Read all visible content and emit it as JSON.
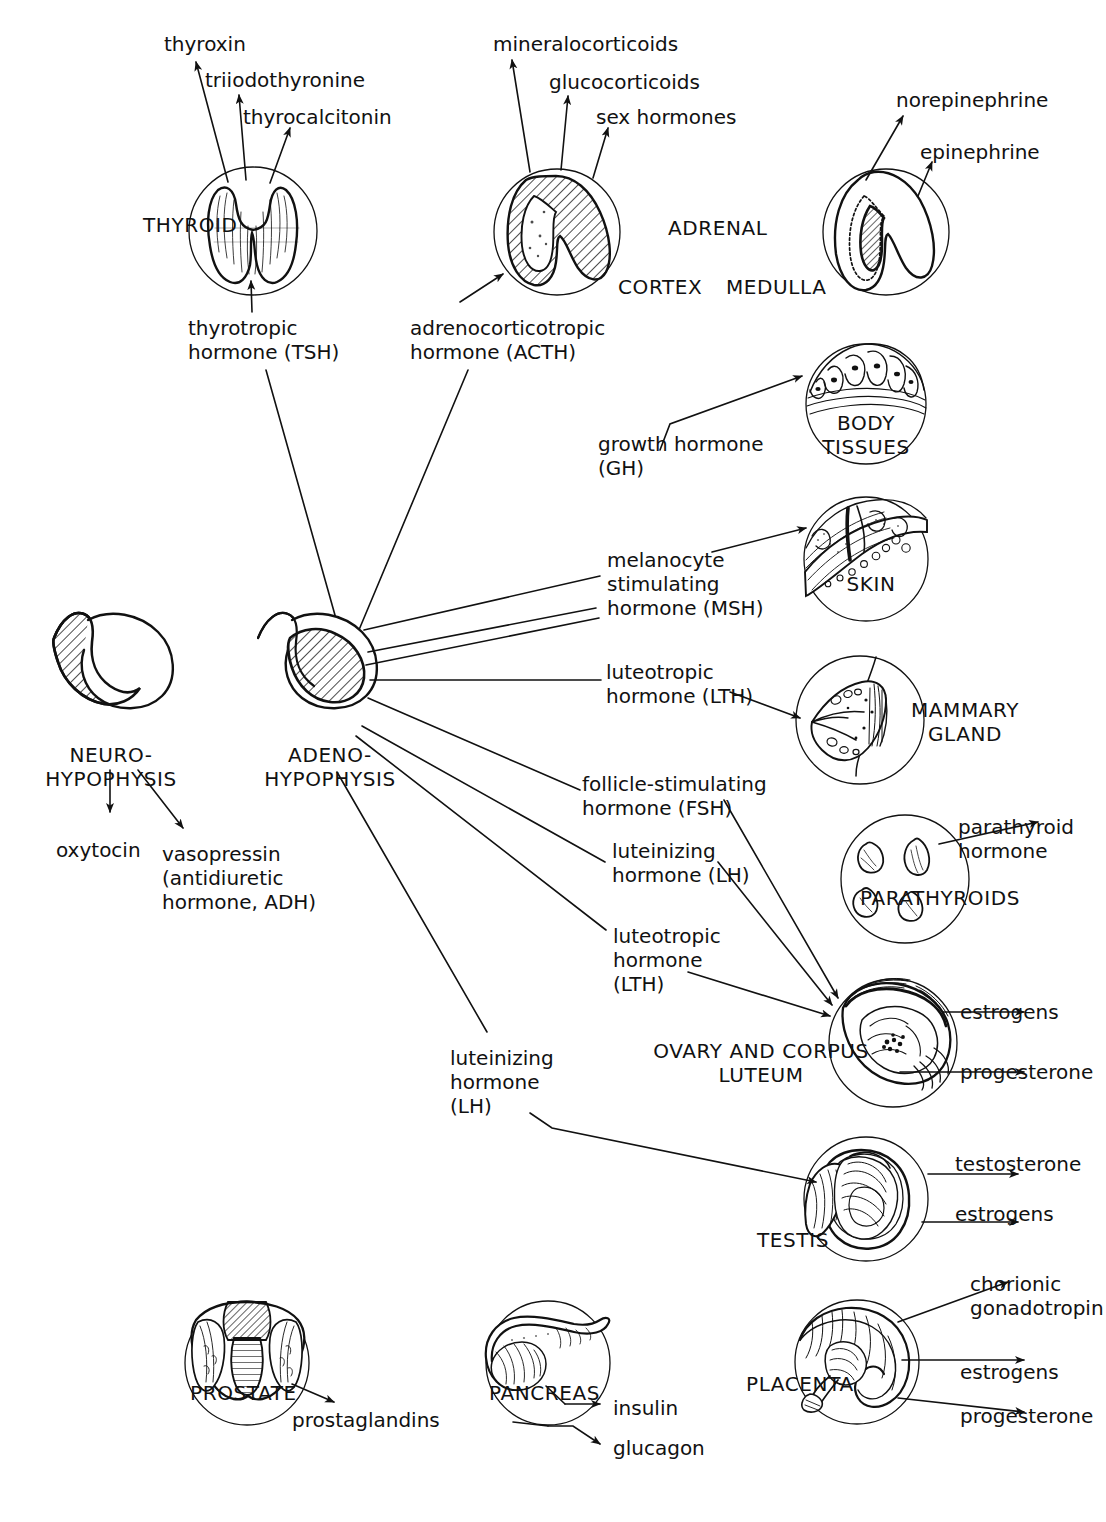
{
  "diagram": {
    "stroke_color": "#111111",
    "background_color": "#ffffff"
  },
  "glands": [
    {
      "id": "thyroid",
      "label": "THYROID",
      "cx": 253,
      "cy": 231,
      "r": 64
    },
    {
      "id": "adrenal_cortex",
      "label": "",
      "cx": 557,
      "cy": 232,
      "r": 63
    },
    {
      "id": "adrenal_medulla",
      "label": "",
      "cx": 886,
      "cy": 232,
      "r": 63
    },
    {
      "id": "body_tissues",
      "label": "BODY\nTISSUES",
      "cx": 866,
      "cy": 404,
      "r": 60
    },
    {
      "id": "skin",
      "label": "SKIN",
      "cx": 866,
      "cy": 559,
      "r": 62
    },
    {
      "id": "mammary",
      "label": "MAMMARY\nGLAND",
      "cx": 860,
      "cy": 720,
      "r": 64
    },
    {
      "id": "parathyroids",
      "label": "PARATHYROIDS",
      "cx": 905,
      "cy": 879,
      "r": 64
    },
    {
      "id": "ovary",
      "label": "OVARY AND CORPUS\nLUTEUM",
      "cx": 893,
      "cy": 1043,
      "r": 64
    },
    {
      "id": "testis",
      "label": "TESTIS",
      "cx": 866,
      "cy": 1199,
      "r": 62
    },
    {
      "id": "prostate",
      "label": "PROSTATE",
      "cx": 247,
      "cy": 1363,
      "r": 62
    },
    {
      "id": "pancreas",
      "label": "PANCREAS",
      "cx": 548,
      "cy": 1363,
      "r": 62
    },
    {
      "id": "placenta",
      "label": "PLACENTA",
      "cx": 857,
      "cy": 1362,
      "r": 62
    }
  ],
  "labels": {
    "thyroxin": "thyroxin",
    "triiodothyronine": "triiodothyronine",
    "thyrocalcitonin": "thyrocalcitonin",
    "thyroid": "THYROID",
    "thyrotropic_hormone": "thyrotropic\nhormone (TSH)",
    "mineralocorticoids": "mineralocorticoids",
    "glucocorticoids": "glucocorticoids",
    "sex_hormones": "sex hormones",
    "adrenal": "ADRENAL",
    "cortex": "CORTEX",
    "medulla": "MEDULLA",
    "acth": "adrenocorticotropic\nhormone (ACTH)",
    "norepinephrine": "norepinephrine",
    "epinephrine": "epinephrine",
    "body_tissues": "BODY\nTISSUES",
    "growth_hormone": "growth hormone\n(GH)",
    "msh": "melanocyte\nstimulating\nhormone (MSH)",
    "skin": "SKIN",
    "lth_mammary": "luteotropic\nhormone (LTH)",
    "mammary_gland": "MAMMARY\nGLAND",
    "neurohypophysis": "NEURO-\nHYPOPHYSIS",
    "adenohypophysis": "ADENO-\nHYPOPHYSIS",
    "oxytocin": "oxytocin",
    "vasopressin": "vasopressin\n(antidiuretic\nhormone, ADH)",
    "fsh": "follicle-stimulating\nhormone (FSH)",
    "lh_ovary": "luteinizing\nhormone (LH)",
    "lth_ovary": "luteotropic\nhormone\n(LTH)",
    "parathyroid_hormone": "parathyroid\nhormone",
    "parathyroids": "PARATHYROIDS",
    "estrogens_ovary": "estrogens",
    "progesterone_ovary": "progesterone",
    "ovary_corpus_luteum": "OVARY AND CORPUS\nLUTEUM",
    "lh_testis": "luteinizing\nhormone\n(LH)",
    "testosterone": "testosterone",
    "estrogens_testis": "estrogens",
    "testis": "TESTIS",
    "prostate": "PROSTATE",
    "prostaglandins": "prostaglandins",
    "pancreas": "PANCREAS",
    "insulin": "insulin",
    "glucagon": "glucagon",
    "placenta": "PLACENTA",
    "chorionic_gonadotropin": "chorionic\ngonadotropin",
    "estrogens_placenta": "estrogens",
    "progesterone_placenta": "progesterone"
  },
  "text_positions": [
    {
      "key": "thyroxin",
      "x": 164,
      "y": 38,
      "align": "left",
      "caps": false
    },
    {
      "key": "triiodothyronine",
      "x": 205,
      "y": 72,
      "align": "left",
      "caps": false
    },
    {
      "key": "thyrocalcitonin",
      "x": 243,
      "y": 108,
      "align": "left",
      "caps": false
    },
    {
      "key": "thyroid",
      "x": 143,
      "y": 217,
      "align": "left",
      "caps": true
    },
    {
      "key": "thyrotropic_hormone",
      "x": 189,
      "y": 320,
      "align": "left",
      "caps": false
    },
    {
      "key": "mineralocorticoids",
      "x": 495,
      "y": 38,
      "align": "left",
      "caps": false
    },
    {
      "key": "glucocorticoids",
      "x": 550,
      "y": 74,
      "align": "left",
      "caps": false
    },
    {
      "key": "sex_hormones",
      "x": 597,
      "y": 108,
      "align": "left",
      "caps": false
    },
    {
      "key": "adrenal",
      "x": 669,
      "y": 219,
      "align": "left",
      "caps": true
    },
    {
      "key": "cortex",
      "x": 619,
      "y": 277,
      "align": "left",
      "caps": true
    },
    {
      "key": "medulla",
      "x": 727,
      "y": 277,
      "align": "left",
      "caps": true
    },
    {
      "key": "acth",
      "x": 411,
      "y": 321,
      "align": "left",
      "caps": false
    },
    {
      "key": "norepinephrine",
      "x": 897,
      "y": 94,
      "align": "left",
      "caps": false
    },
    {
      "key": "epinephrine",
      "x": 921,
      "y": 144,
      "align": "left",
      "caps": false
    },
    {
      "key": "growth_hormone",
      "x": 599,
      "y": 437,
      "align": "left",
      "caps": false
    },
    {
      "key": "msh",
      "x": 608,
      "y": 552,
      "align": "left",
      "caps": false
    },
    {
      "key": "lth_mammary",
      "x": 607,
      "y": 664,
      "align": "left",
      "caps": false
    },
    {
      "key": "neurohypophysis",
      "x": 52,
      "y": 750,
      "align": "left",
      "caps": true
    },
    {
      "key": "adenohypophysis",
      "x": 269,
      "y": 750,
      "align": "left",
      "caps": true
    },
    {
      "key": "oxytocin",
      "x": 57,
      "y": 845,
      "align": "left",
      "caps": false
    },
    {
      "key": "vasopressin",
      "x": 163,
      "y": 847,
      "align": "left",
      "caps": false
    },
    {
      "key": "fsh",
      "x": 583,
      "y": 776,
      "align": "left",
      "caps": false
    },
    {
      "key": "lh_ovary",
      "x": 613,
      "y": 843,
      "align": "left",
      "caps": false
    },
    {
      "key": "lth_ovary",
      "x": 614,
      "y": 928,
      "align": "left",
      "caps": false
    },
    {
      "key": "parathyroid_hormone",
      "x": 960,
      "y": 821,
      "align": "left",
      "caps": false
    },
    {
      "key": "estrogens_ovary",
      "x": 962,
      "y": 1002,
      "align": "left",
      "caps": false
    },
    {
      "key": "progesterone_ovary",
      "x": 962,
      "y": 1062,
      "align": "left",
      "caps": false
    },
    {
      "key": "lh_testis",
      "x": 451,
      "y": 1051,
      "align": "left",
      "caps": false
    },
    {
      "key": "testosterone",
      "x": 957,
      "y": 1155,
      "align": "left",
      "caps": false
    },
    {
      "key": "estrogens_testis",
      "x": 957,
      "y": 1204,
      "align": "left",
      "caps": false
    },
    {
      "key": "prostaglandins",
      "x": 294,
      "y": 1412,
      "align": "left",
      "caps": false
    },
    {
      "key": "insulin",
      "x": 615,
      "y": 1402,
      "align": "left",
      "caps": false
    },
    {
      "key": "glucagon",
      "x": 615,
      "y": 1442,
      "align": "left",
      "caps": false
    },
    {
      "key": "chorionic_gonadotropin",
      "x": 972,
      "y": 1277,
      "align": "left",
      "caps": false
    },
    {
      "key": "estrogens_placenta",
      "x": 962,
      "y": 1365,
      "align": "left",
      "caps": false
    },
    {
      "key": "progesterone_placenta",
      "x": 962,
      "y": 1409,
      "align": "left",
      "caps": false
    }
  ],
  "gland_captions": [
    {
      "key": "body_tissues",
      "x": 866,
      "y": 419,
      "align": "center"
    },
    {
      "key": "skin",
      "x": 871,
      "y": 579,
      "align": "center"
    },
    {
      "key": "mammary_gland",
      "x": 963,
      "y": 705,
      "align": "center"
    },
    {
      "key": "parathyroids",
      "x": 922,
      "y": 888,
      "align": "center"
    },
    {
      "key": "ovary_corpus_luteum",
      "x": 759,
      "y": 1042,
      "align": "center"
    },
    {
      "key": "testis",
      "x": 788,
      "y": 1234,
      "align": "center"
    },
    {
      "key": "prostate",
      "x": 250,
      "y": 1388,
      "align": "center"
    },
    {
      "key": "pancreas",
      "x": 553,
      "y": 1388,
      "align": "center"
    },
    {
      "key": "placenta",
      "x": 790,
      "y": 1378,
      "align": "center"
    }
  ],
  "connections": [
    {
      "from": "thyroid",
      "to": "thyroxin",
      "type": "arrow"
    },
    {
      "from": "thyroid",
      "to": "triiodothyronine",
      "type": "arrow"
    },
    {
      "from": "thyroid",
      "to": "thyrocalcitonin",
      "type": "arrow"
    },
    {
      "from": "thyrotropic_hormone",
      "to": "thyroid",
      "type": "arrow"
    },
    {
      "from": "adenohypophysis",
      "to": "thyrotropic_hormone",
      "type": "line"
    },
    {
      "from": "adrenal_cortex",
      "to": "mineralocorticoids",
      "type": "arrow"
    },
    {
      "from": "adrenal_cortex",
      "to": "glucocorticoids",
      "type": "arrow"
    },
    {
      "from": "adrenal_cortex",
      "to": "sex_hormones",
      "type": "arrow"
    },
    {
      "from": "acth",
      "to": "adrenal_cortex",
      "type": "arrow"
    },
    {
      "from": "adenohypophysis",
      "to": "acth",
      "type": "line"
    },
    {
      "from": "adrenal_medulla",
      "to": "norepinephrine",
      "type": "arrow"
    },
    {
      "from": "adrenal_medulla",
      "to": "epinephrine",
      "type": "arrow"
    },
    {
      "from": "adenohypophysis",
      "to": "growth_hormone",
      "type": "line"
    },
    {
      "from": "growth_hormone",
      "to": "body_tissues",
      "type": "arrow"
    },
    {
      "from": "adenohypophysis",
      "to": "msh",
      "type": "line"
    },
    {
      "from": "msh",
      "to": "skin",
      "type": "arrow"
    },
    {
      "from": "adenohypophysis",
      "to": "lth_mammary",
      "type": "line"
    },
    {
      "from": "lth_mammary",
      "to": "mammary",
      "type": "arrow"
    },
    {
      "from": "adenohypophysis",
      "to": "fsh",
      "type": "line"
    },
    {
      "from": "fsh",
      "to": "ovary",
      "type": "arrow"
    },
    {
      "from": "adenohypophysis",
      "to": "lh_ovary",
      "type": "line"
    },
    {
      "from": "lh_ovary",
      "to": "ovary",
      "type": "arrow"
    },
    {
      "from": "adenohypophysis",
      "to": "lth_ovary",
      "type": "line"
    },
    {
      "from": "lth_ovary",
      "to": "ovary",
      "type": "arrow"
    },
    {
      "from": "adenohypophysis",
      "to": "lh_testis",
      "type": "line"
    },
    {
      "from": "lh_testis",
      "to": "testis",
      "type": "arrow"
    },
    {
      "from": "neurohypophysis",
      "to": "oxytocin",
      "type": "arrow"
    },
    {
      "from": "neurohypophysis",
      "to": "vasopressin",
      "type": "arrow"
    },
    {
      "from": "parathyroids",
      "to": "parathyroid_hormone",
      "type": "arrow"
    },
    {
      "from": "ovary",
      "to": "estrogens_ovary",
      "type": "arrow"
    },
    {
      "from": "ovary",
      "to": "progesterone_ovary",
      "type": "arrow"
    },
    {
      "from": "testis",
      "to": "testosterone",
      "type": "arrow"
    },
    {
      "from": "testis",
      "to": "estrogens_testis",
      "type": "arrow"
    },
    {
      "from": "prostate",
      "to": "prostaglandins",
      "type": "arrow"
    },
    {
      "from": "pancreas",
      "to": "insulin",
      "type": "arrow"
    },
    {
      "from": "pancreas",
      "to": "glucagon",
      "type": "arrow"
    },
    {
      "from": "placenta",
      "to": "chorionic_gonadotropin",
      "type": "arrow"
    },
    {
      "from": "placenta",
      "to": "estrogens_placenta",
      "type": "arrow"
    },
    {
      "from": "placenta",
      "to": "progesterone_placenta",
      "type": "arrow"
    }
  ]
}
